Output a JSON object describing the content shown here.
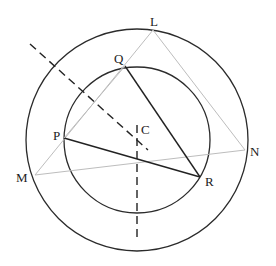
{
  "diagram": {
    "center": {
      "name": "C",
      "x": 137,
      "y": 140
    },
    "circles": [
      {
        "name": "outer-circle",
        "cx": 137,
        "cy": 140,
        "r": 111
      },
      {
        "name": "inner-circle",
        "cx": 137,
        "cy": 140,
        "r": 73
      }
    ],
    "points": {
      "L": {
        "x": 153,
        "y": 30,
        "label": "L",
        "lx": 150,
        "ly": 26
      },
      "M": {
        "x": 35,
        "y": 175,
        "label": "M",
        "lx": 16,
        "ly": 182
      },
      "N": {
        "x": 245,
        "y": 150,
        "label": "N",
        "lx": 250,
        "ly": 156
      },
      "Q": {
        "x": 125,
        "y": 66,
        "label": "Q",
        "lx": 114,
        "ly": 63
      },
      "P": {
        "x": 64,
        "y": 138,
        "label": "P",
        "lx": 53,
        "ly": 140
      },
      "R": {
        "x": 200,
        "y": 177,
        "label": "R",
        "lx": 205,
        "ly": 186
      },
      "C": {
        "label": "C",
        "lx": 141,
        "ly": 134
      }
    },
    "triangle_outer": {
      "vertices": [
        "L",
        "M",
        "N"
      ],
      "style": "thin-gray"
    },
    "triangle_inner": {
      "vertices": [
        "Q",
        "P",
        "R"
      ],
      "style": "thick-black",
      "sides": [
        "QR",
        "PR"
      ]
    },
    "dashed_lines": [
      {
        "name": "bisector-diagonal",
        "x1": 30,
        "y1": 44,
        "x2": 148,
        "y2": 150
      },
      {
        "name": "bisector-vertical",
        "x1": 137,
        "y1": 125,
        "x2": 137,
        "y2": 240
      }
    ]
  }
}
